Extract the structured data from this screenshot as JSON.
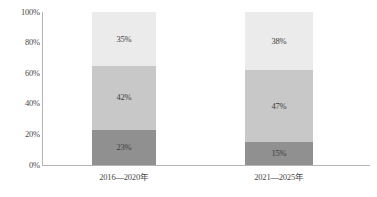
{
  "chart_data": {
    "type": "bar",
    "title": "",
    "subtitle": "",
    "xlabel": "",
    "ylabel": "",
    "stacked": true,
    "stack_total": 100,
    "grid": false,
    "legend": "none",
    "ylim": [
      0,
      100
    ],
    "ytick_labels": [
      "100%",
      "80%",
      "60%",
      "40%",
      "20%",
      "0%"
    ],
    "ytick_values": [
      100,
      80,
      60,
      40,
      20,
      0
    ],
    "categories": [
      "2016—2020年",
      "2021—2025年"
    ],
    "series": [
      {
        "name": "bottom",
        "color": "#909090",
        "values": [
          23,
          15
        ],
        "labels": [
          "23%",
          "15%"
        ]
      },
      {
        "name": "middle",
        "color": "#c8c8c8",
        "values": [
          42,
          47
        ],
        "labels": [
          "42%",
          "47%"
        ]
      },
      {
        "name": "top",
        "color": "#ebebeb",
        "values": [
          35,
          38
        ],
        "labels": [
          "35%",
          "38%"
        ]
      }
    ]
  },
  "axis": {
    "line_color": "#b4b4b4"
  },
  "bars": [
    {
      "category": "2016—2020年",
      "segments": [
        {
          "label": "35%",
          "value": 35,
          "color": "#ebebeb"
        },
        {
          "label": "42%",
          "value": 42,
          "color": "#c8c8c8"
        },
        {
          "label": "23%",
          "value": 23,
          "color": "#909090"
        }
      ]
    },
    {
      "category": "2021—2025年",
      "segments": [
        {
          "label": "38%",
          "value": 38,
          "color": "#ebebeb"
        },
        {
          "label": "47%",
          "value": 47,
          "color": "#c8c8c8"
        },
        {
          "label": "15%",
          "value": 15,
          "color": "#909090"
        }
      ]
    }
  ],
  "ticks": [
    {
      "label": "100%",
      "value": 100
    },
    {
      "label": "80%",
      "value": 80
    },
    {
      "label": "60%",
      "value": 60
    },
    {
      "label": "40%",
      "value": 40
    },
    {
      "label": "20%",
      "value": 20
    },
    {
      "label": "0%",
      "value": 0
    }
  ]
}
